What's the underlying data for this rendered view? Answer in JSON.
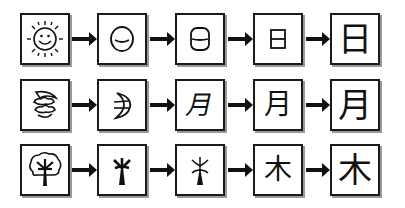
{
  "rows": [
    {
      "name": "sun",
      "meaning": "sun",
      "final_character": "日",
      "stages": [
        {
          "stage": 1,
          "description": "pictograph of smiling sun with rays",
          "icon": "sun-icon"
        },
        {
          "stage": 2,
          "description": "circle with curved stroke",
          "glyph": "◡"
        },
        {
          "stage": 3,
          "description": "rounded rectangle with middle stroke",
          "glyph": "⊖"
        },
        {
          "stage": 4,
          "description": "rectangle with middle stroke",
          "glyph": "日"
        },
        {
          "stage": 5,
          "description": "modern character",
          "glyph": "日"
        }
      ]
    },
    {
      "name": "moon",
      "meaning": "moon",
      "final_character": "月",
      "stages": [
        {
          "stage": 1,
          "description": "pictograph of crescent moon with clouds",
          "icon": "moon-cloud-icon"
        },
        {
          "stage": 2,
          "description": "crescent with strokes",
          "icon": "crescent-icon"
        },
        {
          "stage": 3,
          "description": "slanted moon form",
          "glyph": "月"
        },
        {
          "stage": 4,
          "description": "moon form",
          "glyph": "月"
        },
        {
          "stage": 5,
          "description": "modern character",
          "glyph": "月"
        }
      ]
    },
    {
      "name": "tree",
      "meaning": "tree / wood",
      "final_character": "木",
      "stages": [
        {
          "stage": 1,
          "description": "pictograph of tree with crown",
          "icon": "tree-icon"
        },
        {
          "stage": 2,
          "description": "bold tree stick figure",
          "icon": "tree-stick-bold-icon"
        },
        {
          "stage": 3,
          "description": "thin tree stick figure",
          "icon": "tree-stick-thin-icon"
        },
        {
          "stage": 4,
          "description": "tree form",
          "glyph": "木"
        },
        {
          "stage": 5,
          "description": "modern character",
          "glyph": "木"
        }
      ]
    }
  ],
  "colors": {
    "stroke": "#111111",
    "shadow": "#9a9a9a",
    "background": "#ffffff"
  }
}
